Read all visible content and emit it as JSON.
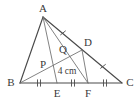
{
  "figure": {
    "kind": "geometry-diagram",
    "background_color": "#ffffff",
    "stroke_color": "#4a4a4a",
    "light_stroke_color": "#6b6b6b",
    "label_color": "#3a3a3a",
    "width": 137,
    "height": 103,
    "points": {
      "A": {
        "label": "A",
        "x": 43,
        "y": 17
      },
      "B": {
        "label": "B",
        "x": 20,
        "y": 83
      },
      "C": {
        "label": "C",
        "x": 122,
        "y": 83
      },
      "D": {
        "label": "D",
        "x": 82,
        "y": 50
      },
      "E": {
        "label": "E",
        "x": 57,
        "y": 83
      },
      "F": {
        "label": "F",
        "x": 88,
        "y": 83
      },
      "P": {
        "label": "P",
        "x": 48,
        "y": 68
      },
      "Q": {
        "label": "Q",
        "x": 66,
        "y": 56
      }
    },
    "label_offsets": {
      "A": {
        "x": 43,
        "y": 8
      },
      "B": {
        "x": 12,
        "y": 83
      },
      "C": {
        "x": 129,
        "y": 83
      },
      "D": {
        "x": 87,
        "y": 43
      },
      "E": {
        "x": 57,
        "y": 94
      },
      "F": {
        "x": 88,
        "y": 94
      },
      "P": {
        "x": 43,
        "y": 65
      },
      "Q": {
        "x": 63,
        "y": 50
      }
    },
    "segments": [
      {
        "name": "side-AB",
        "from": "A",
        "to": "B",
        "style": "edge"
      },
      {
        "name": "side-BC",
        "from": "B",
        "to": "C",
        "style": "edge"
      },
      {
        "name": "side-AC",
        "from": "A",
        "to": "C",
        "style": "edge"
      },
      {
        "name": "cevian-AE",
        "from": "A",
        "to": "E",
        "style": "cevian"
      },
      {
        "name": "cevian-AF",
        "from": "A",
        "to": "F",
        "style": "cevian"
      },
      {
        "name": "cevian-BD",
        "from": "B",
        "to": "D",
        "style": "cevian"
      },
      {
        "name": "segment-DF",
        "from": "D",
        "to": "F",
        "style": "cevian"
      }
    ],
    "tick_marks": [
      {
        "name": "tick-BE",
        "on": "BC",
        "x": 39,
        "y": 83,
        "count": 2,
        "orientation": "vertical"
      },
      {
        "name": "tick-EF",
        "on": "BC",
        "x": 73,
        "y": 83,
        "count": 2,
        "orientation": "vertical"
      },
      {
        "name": "tick-FC",
        "on": "BC",
        "x": 105,
        "y": 83,
        "count": 2,
        "orientation": "vertical"
      },
      {
        "name": "tick-AD",
        "on": "AC",
        "x": 63,
        "y": 34,
        "count": 1,
        "orientation": "perpendicular"
      },
      {
        "name": "tick-DC",
        "on": "AC",
        "x": 103,
        "y": 67,
        "count": 1,
        "orientation": "perpendicular"
      }
    ],
    "measurements": [
      {
        "name": "length-PQ",
        "text": "4 cm",
        "x": 67,
        "y": 72
      }
    ]
  }
}
